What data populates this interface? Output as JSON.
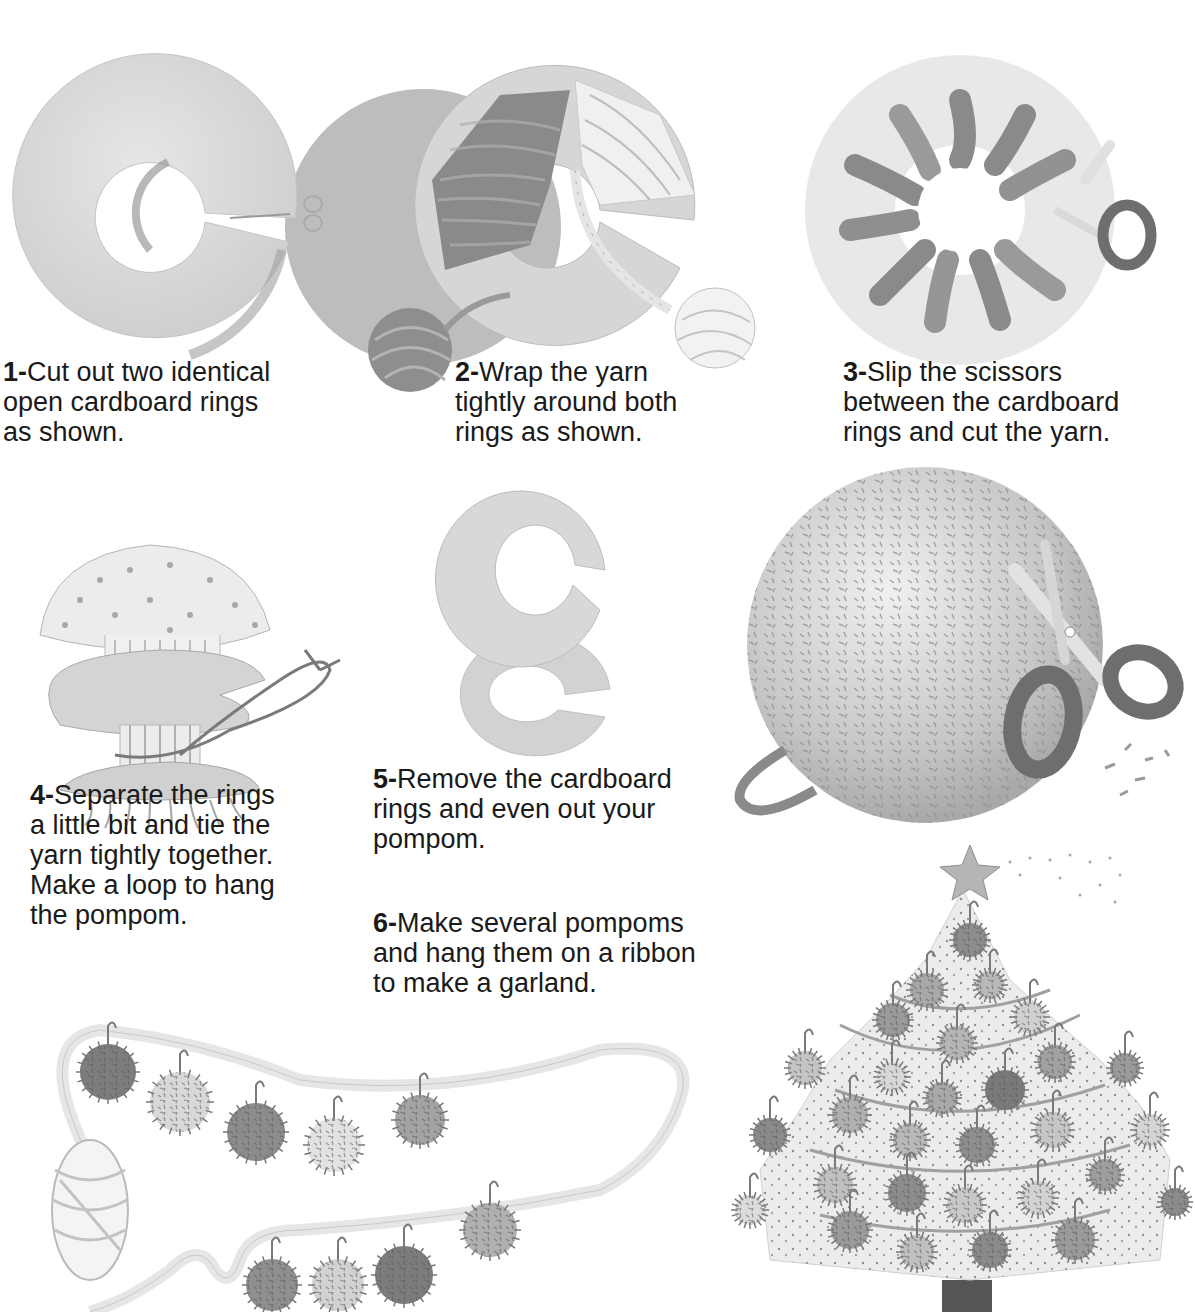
{
  "page": {
    "cut_off_heading": "Gather the needed yarn, cardboard, scissors and a ribbon to make a pompom"
  },
  "colors": {
    "text": "#1a1a1a",
    "cardboard_light": "#dcdcdc",
    "cardboard_shadow": "#a8a8a8",
    "yarn_dark": "#8a8a8a",
    "yarn_light": "#ececec",
    "scissor_handle": "#6e6e6e",
    "tree_trunk": "#555555"
  },
  "steps": [
    {
      "number": "1-",
      "lines": [
        "Cut out two identical",
        "open cardboard rings",
        "as shown."
      ]
    },
    {
      "number": "2-",
      "lines": [
        "Wrap the yarn",
        "tightly around both",
        "rings as shown."
      ]
    },
    {
      "number": "3-",
      "lines": [
        "Slip the scissors",
        "between the cardboard",
        "rings and cut the yarn."
      ]
    },
    {
      "number": "4-",
      "lines": [
        "Separate the rings",
        "a little bit and tie the",
        "yarn tightly together.",
        "Make a loop to hang",
        "the pompom."
      ]
    },
    {
      "number": "5-",
      "lines": [
        "Remove the cardboard",
        "rings and even out your",
        "pompom."
      ]
    },
    {
      "number": "6-",
      "lines": [
        "Make several pompoms",
        "and hang them on a ribbon",
        "to make a garland."
      ]
    }
  ],
  "illustrations": [
    {
      "id": "cardboard-ring",
      "icon": "cardboard-ring-icon"
    },
    {
      "id": "wrapped-ring",
      "icon": "yarn-wrapped-ring-icon"
    },
    {
      "id": "cut-yarn-ring",
      "icon": "cut-yarn-ring-icon"
    },
    {
      "id": "tied-pompom",
      "icon": "tied-pompom-icon"
    },
    {
      "id": "two-rings",
      "icon": "separated-rings-icon"
    },
    {
      "id": "finished-pompom",
      "icon": "pompom-with-scissors-icon"
    },
    {
      "id": "garland",
      "icon": "pompom-garland-icon"
    },
    {
      "id": "christmas-tree",
      "icon": "decorated-tree-icon"
    }
  ]
}
